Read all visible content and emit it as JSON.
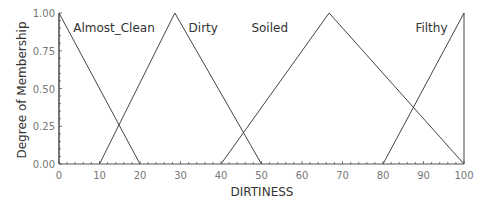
{
  "chart_data": {
    "type": "line",
    "title": "",
    "xlabel": "DIRTINESS",
    "ylabel": "Degree of Membership",
    "xlim": [
      0,
      100
    ],
    "ylim": [
      0,
      1
    ],
    "x_ticks": [
      "0",
      "10",
      "20",
      "30",
      "40",
      "50",
      "60",
      "70",
      "80",
      "90",
      "100"
    ],
    "y_ticks": [
      "0.00",
      "0.25",
      "0.50",
      "0.75",
      "1.00"
    ],
    "grid": false,
    "legend": "inline labels",
    "series": [
      {
        "name": "Almost_Clean",
        "x": [
          0,
          0,
          20
        ],
        "y": [
          0,
          1,
          0
        ],
        "label_x": 3.5
      },
      {
        "name": "Dirty",
        "x": [
          10,
          28.6,
          50
        ],
        "y": [
          0,
          1,
          0
        ],
        "label_x": 32
      },
      {
        "name": "Soiled",
        "x": [
          40,
          66.7,
          100
        ],
        "y": [
          0,
          1,
          0
        ],
        "label_x": 47.5
      },
      {
        "name": "Filthy",
        "x": [
          80,
          100,
          100
        ],
        "y": [
          0,
          1,
          0
        ],
        "label_x": 88
      }
    ]
  },
  "colors": {
    "line": "#444444",
    "axis": "#555555",
    "tick_label": "#777777",
    "text": "#333333"
  }
}
